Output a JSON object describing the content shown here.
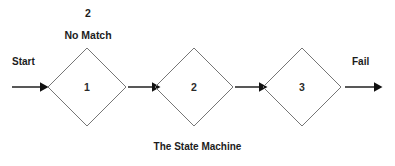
{
  "diagram": {
    "caption": "The State Machine",
    "background_color": "#ffffff",
    "node_stroke_color": "#767676",
    "arrow_color": "#111111",
    "text_color": "#1c1c1c",
    "entry_label": "Start",
    "exit_label": "Fail",
    "annotation": {
      "count": "2",
      "condition": "No Match"
    },
    "states": [
      {
        "label": "1",
        "cx": 87,
        "cy": 87,
        "r": 39
      },
      {
        "label": "2",
        "cx": 194,
        "cy": 87,
        "r": 39
      },
      {
        "label": "3",
        "cx": 302,
        "cy": 87,
        "r": 39
      }
    ],
    "transitions": [
      {
        "name": "start-arrow",
        "x1": 12,
        "x2": 47,
        "y": 87
      },
      {
        "name": "state1-to-state2-arrow",
        "x1": 127,
        "x2": 160,
        "y": 87
      },
      {
        "name": "state2-to-state3-arrow",
        "x1": 234,
        "x2": 267,
        "y": 87
      },
      {
        "name": "fail-arrow",
        "x1": 345,
        "x2": 382,
        "y": 87
      }
    ]
  }
}
